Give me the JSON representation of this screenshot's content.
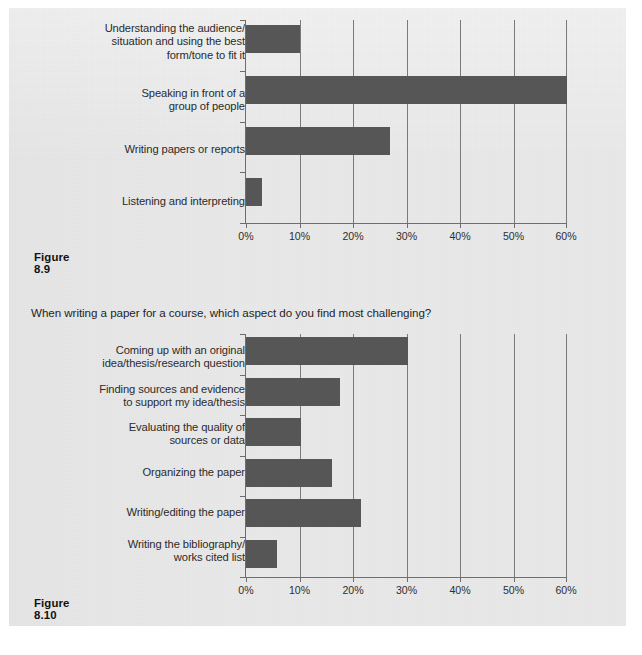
{
  "page": {
    "background_color": "#e9e9e9",
    "bar_color": "#565656",
    "axis_color": "#6d6d6d",
    "text_color": "#2b2b2b"
  },
  "figures": [
    {
      "caption": "Figure 8.9",
      "title": "",
      "chart_data": {
        "type": "bar",
        "orientation": "horizontal",
        "title": "",
        "xlabel": "",
        "ylabel": "",
        "xlim": [
          0,
          60
        ],
        "xticks": [
          0,
          10,
          20,
          30,
          40,
          50,
          60
        ],
        "xticklabels": [
          "0%",
          "10%",
          "20%",
          "30%",
          "40%",
          "50%",
          "60%"
        ],
        "grid": "vertical",
        "legend": "none",
        "categories": [
          "Understanding the audience/\nsituation and using the best\nform/tone to fit it",
          "Speaking in front of a\ngroup of people",
          "Writing papers or reports",
          "Listening and interpreting"
        ],
        "values": [
          10,
          60,
          27,
          3
        ]
      }
    },
    {
      "caption": "Figure 8.10",
      "title": "When writing a paper for a course, which aspect do you find most challenging?",
      "chart_data": {
        "type": "bar",
        "orientation": "horizontal",
        "title": "When writing a paper for a course, which aspect do you find most challenging?",
        "xlabel": "",
        "ylabel": "",
        "xlim": [
          0,
          60
        ],
        "xticks": [
          0,
          10,
          20,
          30,
          40,
          50,
          60
        ],
        "xticklabels": [
          "0%",
          "10%",
          "20%",
          "30%",
          "40%",
          "50%",
          "60%"
        ],
        "grid": "vertical",
        "legend": "none",
        "categories": [
          "Coming up with an original\nidea/thesis/research question",
          "Finding sources and evidence\nto support my idea/thesis",
          "Evaluating the quality of\nsources or data",
          "Organizing the paper",
          "Writing/editing the paper",
          "Writing the bibliography/\nworks cited list"
        ],
        "values": [
          30.3,
          17.6,
          10.2,
          16.1,
          21.5,
          5.8
        ]
      }
    }
  ]
}
